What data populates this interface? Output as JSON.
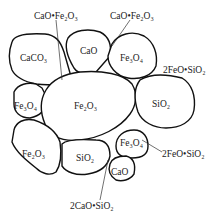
{
  "diagram": {
    "grain_labels": {
      "caco3": "CaCO₃",
      "cao_top": "CaO",
      "fe3o4_top": "Fe₃O₄",
      "fe3o4_left": "Fe₃O₄",
      "fe2o3_center": "Fe₂O₃",
      "sio2_right": "SiO₂",
      "fe2o3_left": "Fe₂O₃",
      "sio2_bottom": "SiO₂",
      "fe3o4_right": "Fe₃O₄",
      "cao_bottom": "CaO"
    },
    "callouts": {
      "cao_fe2o3_left": "CaO•Fe₂O₃",
      "cao_fe2o3_right": "CaO•Fe₂O₃",
      "fayalite_top": "2FeO•SiO₂",
      "fayalite_bottom": "2FeO•SiO₂",
      "dicalcium_silicate": "2CaO•SiO₂"
    }
  }
}
